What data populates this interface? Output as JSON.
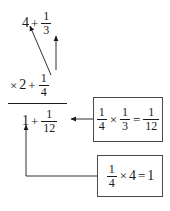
{
  "figure": {
    "type": "annotated-arithmetic-diagram",
    "ink_color": "#1a1a1a",
    "box_border_color": "#4a4a4a",
    "background_color": "#ffffff"
  },
  "expression": {
    "top_row": {
      "whole": "4",
      "plus": "+",
      "fraction": {
        "numerator": "1",
        "denominator": "3"
      }
    },
    "second_row": {
      "times": "×",
      "whole": "2",
      "plus": "+",
      "fraction": {
        "numerator": "1",
        "denominator": "4"
      }
    },
    "result_row": {
      "whole": "1",
      "plus": "+",
      "fraction": {
        "numerator": "1",
        "denominator": "12"
      }
    }
  },
  "callouts": [
    {
      "id": "callout-one-twelfth",
      "left_fraction": {
        "numerator": "1",
        "denominator": "4"
      },
      "times": "×",
      "right_fraction": {
        "numerator": "1",
        "denominator": "3"
      },
      "equals": "=",
      "result_fraction": {
        "numerator": "1",
        "denominator": "12"
      }
    },
    {
      "id": "callout-one",
      "left_fraction": {
        "numerator": "1",
        "denominator": "4"
      },
      "times": "×",
      "right_whole": "4",
      "equals": "=",
      "result_whole": "1"
    }
  ],
  "arrows": [
    {
      "name": "arrow-quarter-to-four",
      "from": "fraction 1/4",
      "to": "whole number 4",
      "style": "diagonal"
    },
    {
      "name": "arrow-quarter-to-third",
      "from": "fraction 1/4",
      "to": "fraction 1/3",
      "style": "vertical"
    },
    {
      "name": "arrow-callout-one-twelfth-to-result",
      "from": "callout 1/4 x 1/3 = 1/12",
      "to": "result fraction 1/12",
      "style": "horizontal"
    },
    {
      "name": "arrow-callout-one-to-result",
      "from": "callout 1/4 x 4 = 1",
      "to": "result whole 1",
      "style": "elbow"
    }
  ]
}
